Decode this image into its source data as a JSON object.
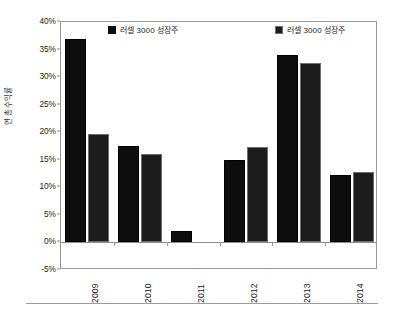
{
  "chart_data": {
    "type": "bar",
    "title": "",
    "subtitle": "",
    "xlabel": "",
    "ylabel": "연 총수익률",
    "categories": [
      "2009",
      "2010",
      "2011",
      "2012",
      "2013",
      "2014"
    ],
    "series": [
      {
        "name": "러셀 3000 성장주",
        "color": "#0d0d0d",
        "values": [
          37.0,
          17.5,
          2.0,
          15.0,
          34.0,
          12.3
        ]
      },
      {
        "name": "러셀 3000 성장주",
        "color": "#1c1c1c",
        "values": [
          19.6,
          16.0,
          null,
          17.3,
          32.5,
          12.7
        ]
      }
    ],
    "ylim": [
      -5,
      40
    ],
    "ytick_values": [
      40,
      35,
      30,
      25,
      20,
      15,
      10,
      5,
      0,
      -5
    ],
    "ytick_labels": [
      "40%",
      "35%",
      "30%",
      "25%",
      "20%",
      "15%",
      "10%",
      "5%",
      "0%",
      "-5%"
    ],
    "grid": false,
    "legend_position": "top-inside",
    "value_format": "percent"
  },
  "legend": {
    "items": [
      {
        "label": "러셀 3000 성장주",
        "color": "#0d0d0d"
      },
      {
        "label": "러셀 3000 성장주",
        "color": "#1c1c1c"
      }
    ]
  },
  "axes": {
    "y_title": "연 총수익률",
    "y_ticks": [
      "40%",
      "35%",
      "30%",
      "25%",
      "20%",
      "15%",
      "10%",
      "5%",
      "0%",
      "-5%"
    ],
    "x_ticks": [
      "2009",
      "2010",
      "2011",
      "2012",
      "2013",
      "2014"
    ]
  }
}
